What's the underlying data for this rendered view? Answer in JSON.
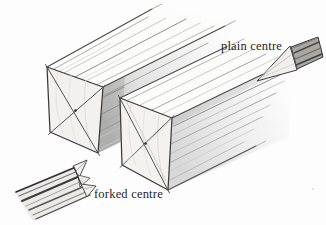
{
  "figure": {
    "type": "pencil-sketch-diagram",
    "labels": [
      {
        "id": "plain-centre",
        "text": "plain centre"
      },
      {
        "id": "forked-centre",
        "text": "forked centre"
      }
    ],
    "objects": [
      "left-timber-blank",
      "right-timber-blank",
      "plain-centre-tool",
      "forked-centre-tool"
    ],
    "colors": {
      "background": "#fdfdfd",
      "outline": "#3a3a3a",
      "diagonal_line": "#4c4c4c",
      "grain_dark": "#8e8e8e",
      "grain_light": "#cccccc",
      "face_fill": "#f3f1ee",
      "shading_fill": "#c2c2c2",
      "text": "#1f1f1f"
    }
  }
}
